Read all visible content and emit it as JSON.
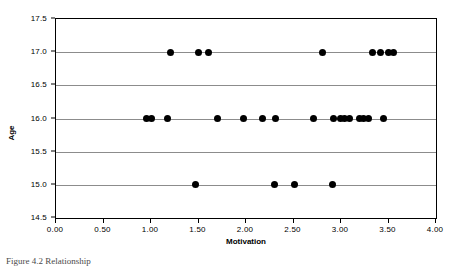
{
  "figure": {
    "caption": "Figure 4.2  Relationship"
  },
  "chart_data": {
    "type": "scatter",
    "title": "",
    "xlabel": "Motivation",
    "ylabel": "Age",
    "xlim": [
      0.0,
      4.0
    ],
    "ylim": [
      14.5,
      17.5
    ],
    "xticks": [
      0.0,
      0.5,
      1.0,
      1.5,
      2.0,
      2.5,
      3.0,
      3.5,
      4.0
    ],
    "xtick_labels": [
      "0.00",
      "0.50",
      "1.00",
      "1.50",
      "2.00",
      "2.50",
      "3.00",
      "3.50",
      "4.00"
    ],
    "yticks": [
      14.5,
      15.0,
      15.5,
      16.0,
      16.5,
      17.0,
      17.5
    ],
    "ytick_labels": [
      "14.5",
      "15.0",
      "15.5",
      "16.0",
      "16.5",
      "17.0",
      "17.5"
    ],
    "grid": "horizontal",
    "grid_color": "#8C8C8C",
    "marker_color": "#000000",
    "marker_size": 7,
    "legend": "none",
    "points": [
      {
        "x": 1.2,
        "y": 17.0
      },
      {
        "x": 1.5,
        "y": 17.0
      },
      {
        "x": 1.61,
        "y": 17.0
      },
      {
        "x": 2.81,
        "y": 17.0
      },
      {
        "x": 3.33,
        "y": 17.0
      },
      {
        "x": 3.42,
        "y": 17.0
      },
      {
        "x": 3.5,
        "y": 17.0
      },
      {
        "x": 3.55,
        "y": 17.0
      },
      {
        "x": 0.95,
        "y": 16.0
      },
      {
        "x": 1.01,
        "y": 16.0
      },
      {
        "x": 1.17,
        "y": 16.0
      },
      {
        "x": 1.7,
        "y": 16.0
      },
      {
        "x": 1.97,
        "y": 16.0
      },
      {
        "x": 2.17,
        "y": 16.0
      },
      {
        "x": 2.31,
        "y": 16.0
      },
      {
        "x": 2.71,
        "y": 16.0
      },
      {
        "x": 2.92,
        "y": 16.0
      },
      {
        "x": 2.99,
        "y": 16.0
      },
      {
        "x": 3.04,
        "y": 16.0
      },
      {
        "x": 3.09,
        "y": 16.0
      },
      {
        "x": 3.19,
        "y": 16.0
      },
      {
        "x": 3.24,
        "y": 16.0
      },
      {
        "x": 3.29,
        "y": 16.0
      },
      {
        "x": 3.45,
        "y": 16.0
      },
      {
        "x": 1.47,
        "y": 15.0
      },
      {
        "x": 2.3,
        "y": 15.0
      },
      {
        "x": 2.51,
        "y": 15.0
      },
      {
        "x": 2.91,
        "y": 15.0
      }
    ]
  }
}
